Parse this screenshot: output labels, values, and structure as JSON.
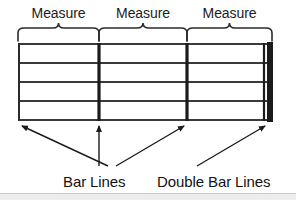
{
  "figure": {
    "title_absent": true,
    "background_color": "#ffffff",
    "ink_color": "#1b1b1b"
  },
  "measures": {
    "labels": [
      {
        "text": "Measure",
        "brace_from_x": 18,
        "brace_to_x": 99
      },
      {
        "text": "Measure",
        "brace_from_x": 99,
        "brace_to_x": 187
      },
      {
        "text": "Measure",
        "brace_from_x": 187,
        "brace_to_x": 272
      }
    ]
  },
  "staff": {
    "line_count": 5,
    "line_ys": [
      44,
      63,
      82,
      101,
      120
    ],
    "left_x": 18,
    "right_x": 272,
    "line_color": "#3a3a3a",
    "bar_lines": [
      {
        "x": 99,
        "thickness": 3,
        "kind": "bar-line"
      },
      {
        "x": 187,
        "thickness": 3,
        "kind": "bar-line"
      }
    ],
    "double_bar_line": {
      "thin_x": 264,
      "thin_thickness": 2,
      "thick_x": 270,
      "thick_thickness": 6,
      "kind": "double-bar-line"
    }
  },
  "callouts": {
    "bar_lines": {
      "label": "Bar Lines",
      "label_x": 63,
      "label_y": 172,
      "leaders": [
        {
          "from_x": 108,
          "from_y": 166,
          "to_x": 20,
          "to_y": 124,
          "arrow": "end"
        },
        {
          "from_x": 99,
          "from_y": 166,
          "to_x": 99,
          "to_y": 124,
          "arrow": "end"
        },
        {
          "from_x": 115,
          "from_y": 166,
          "to_x": 186,
          "to_y": 124,
          "arrow": "end"
        }
      ]
    },
    "double_bar_lines": {
      "label": "Double Bar Lines",
      "label_x": 157,
      "label_y": 172,
      "leaders": [
        {
          "from_x": 196,
          "from_y": 166,
          "to_x": 267,
          "to_y": 124,
          "arrow": "end"
        }
      ]
    }
  },
  "bottom_band": {
    "color": "#ededed",
    "border_color": "#c9c9c9"
  }
}
